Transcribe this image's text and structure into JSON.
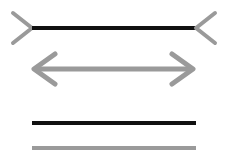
{
  "figure": {
    "type": "muller-lyer-illusion-diagram",
    "canvas": {
      "width": 229,
      "height": 162,
      "background": "#ffffff"
    },
    "colors": {
      "black": "#111111",
      "gray": "#9a9a9a"
    },
    "elements": [
      {
        "id": "fins-in-line",
        "label": "Black line with inward fins",
        "shaft": {
          "color": "#111111",
          "x1": 32,
          "y1": 28,
          "x2": 196,
          "y2": 28,
          "thickness": 4
        },
        "left_cap": {
          "glyph": ">",
          "color": "#9a9a9a",
          "vertex_x": 32,
          "vertex_y": 28,
          "tail_x": 13,
          "top_y": 13,
          "bottom_y": 43,
          "thickness": 4
        },
        "right_cap": {
          "glyph": "<",
          "color": "#9a9a9a",
          "vertex_x": 196,
          "vertex_y": 28,
          "tail_x": 215,
          "top_y": 13,
          "bottom_y": 43,
          "thickness": 4
        }
      },
      {
        "id": "fins-out-arrow",
        "label": "Gray double-headed arrow",
        "shaft": {
          "color": "#9a9a9a",
          "x1": 36,
          "y1": 69,
          "x2": 191,
          "y2": 69,
          "thickness": 5
        },
        "left_cap": {
          "glyph": "<",
          "color": "#9a9a9a",
          "vertex_x": 34,
          "vertex_y": 69,
          "tail_x": 55,
          "top_y": 54,
          "bottom_y": 84,
          "thickness": 5
        },
        "right_cap": {
          "glyph": ">",
          "color": "#9a9a9a",
          "vertex_x": 193,
          "vertex_y": 69,
          "tail_x": 172,
          "top_y": 54,
          "bottom_y": 84,
          "thickness": 5
        }
      },
      {
        "id": "plain-black-line",
        "label": "Plain black reference line",
        "shaft": {
          "color": "#111111",
          "x1": 32,
          "y1": 123,
          "x2": 196,
          "y2": 123,
          "thickness": 4
        }
      },
      {
        "id": "plain-gray-line",
        "label": "Plain gray reference line",
        "shaft": {
          "color": "#9a9a9a",
          "x1": 32,
          "y1": 148,
          "x2": 196,
          "y2": 148,
          "thickness": 4
        }
      }
    ]
  }
}
